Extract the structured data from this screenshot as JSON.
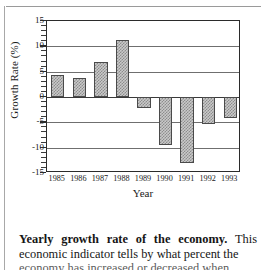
{
  "figure": {
    "ylabel": "Growth Rate (%)",
    "xlabel": "Year"
  },
  "caption": {
    "lead": "Yearly growth rate of the economy.",
    "line1_tail": " This",
    "line2": "economic indicator tells by what percent the",
    "line3": "economy has increased or decreased when"
  },
  "chart_data": {
    "type": "bar",
    "title": "Yearly growth rate of the economy",
    "xlabel": "Year",
    "ylabel": "Growth Rate (%)",
    "categories": [
      "1985",
      "1986",
      "1987",
      "1988",
      "1989",
      "1990",
      "1991",
      "1992",
      "1993"
    ],
    "values": [
      4.3,
      3.8,
      7.0,
      11.2,
      -2.2,
      -9.5,
      -13.0,
      -5.3,
      -4.2
    ],
    "ylim": [
      -15,
      15
    ],
    "yticks": [
      15,
      10,
      5,
      0,
      -5,
      -10,
      -15
    ],
    "ytick_labels": [
      "15",
      "10",
      "5",
      "0",
      "-5",
      "-10",
      "-15"
    ],
    "minor_tick_step": 1,
    "grid": true,
    "legend": false,
    "bar_fill": "#c9c9c9",
    "bar_hatch": "crosshatch",
    "bar_edge_color": "#4a4a4a",
    "axis_color": "#2b2b2b"
  }
}
